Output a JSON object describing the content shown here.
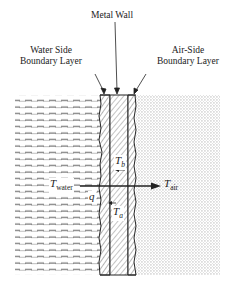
{
  "labels": {
    "metal_wall": "Metal Wall",
    "water_side_line1": "Water Side",
    "water_side_line2": "Boundary Layer",
    "air_side_line1": "Air-Side",
    "air_side_line2": "Boundary Layer",
    "t_water_main": "T",
    "t_water_sub": "water",
    "t_air_main": "T",
    "t_air_sub": "air",
    "t_b_main": "T",
    "t_b_sub": "b",
    "t_a_main": "T",
    "t_a_sub": "a",
    "q": "q"
  },
  "colors": {
    "ink": "#222222",
    "water_dash": "#555555",
    "air_dot": "#8a8a8a",
    "background": "#ffffff"
  }
}
